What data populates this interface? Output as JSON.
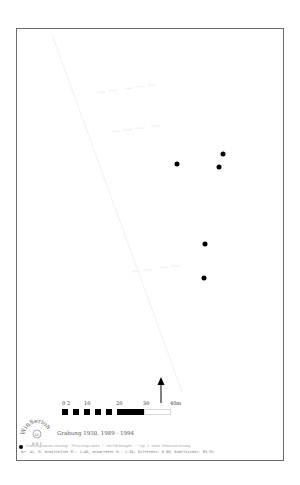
{
  "map": {
    "points": [
      {
        "x": 177,
        "y": 164
      },
      {
        "x": 223,
        "y": 154
      },
      {
        "x": 219,
        "y": 167
      },
      {
        "x": 205,
        "y": 244
      },
      {
        "x": 204,
        "y": 278
      }
    ],
    "north_arrow": "north-arrow",
    "scale_bar": {
      "ticks": [
        "0",
        "2",
        "10",
        "20",
        "30",
        "40m"
      ],
      "unit": "m"
    },
    "logo": {
      "text": "WinSerion",
      "sub": "0 0 1",
      "inner": "KG"
    },
    "excavation_caption": "Grabung 1930, 1989 - 1994",
    "legend": {
      "caption_uncertain": true,
      "caption_line1": "Grabungsumzeichnung: Pfostengruben / Verfärbungen – Typ 1 ohne Kennzeichnung",
      "caption_line2": "Nr. 41, M. ermittelter M.: 1:40, erwarteter M.: 1:34, Differenz: 0.00, Koeffizient: 85,9%"
    }
  },
  "colors": {
    "frame": "#6b6b6b",
    "points": "#000000",
    "background": "#ffffff"
  }
}
